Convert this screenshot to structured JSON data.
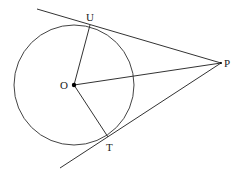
{
  "diagram": {
    "stroke_color": "#333333",
    "points": {
      "O": {
        "label": "O",
        "x": 74,
        "y": 85
      },
      "U": {
        "label": "U",
        "x": 90,
        "y": 25
      },
      "T": {
        "label": "T",
        "x": 108,
        "y": 137
      },
      "P": {
        "label": "P",
        "x": 221,
        "y": 63
      }
    },
    "circle": {
      "center": "O",
      "radius": 60
    },
    "segments": [
      {
        "from": "O",
        "to": "U"
      },
      {
        "from": "O",
        "to": "T"
      },
      {
        "from": "O",
        "to": "P"
      }
    ],
    "tangent_lines": [
      {
        "through": [
          "U",
          "P"
        ]
      },
      {
        "through": [
          "T",
          "P"
        ]
      }
    ]
  }
}
